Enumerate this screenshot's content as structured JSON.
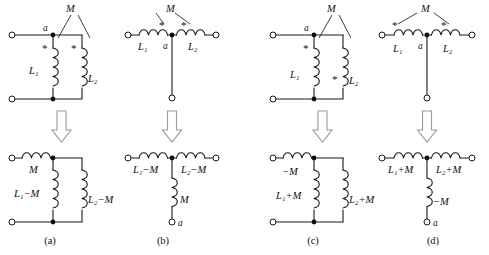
{
  "figure": {
    "background_color": "#ffffff",
    "ink_color": "#101010",
    "arrow_color": "#9a9a9a",
    "transform_arrow_icon": "down-arrow-hollow"
  },
  "symbols": {
    "dot_marker": "*",
    "node_dot": "node-dot",
    "open_terminal": "open-terminal-circle",
    "coil": "inductor-coil",
    "mutual_label": "M",
    "node_label": "a"
  },
  "panels": [
    {
      "id": "a",
      "caption": "(a)",
      "orientation": "parallel-vertical",
      "top": {
        "mutual_label": "M",
        "node_label": "a",
        "left_coil_label": "L₁",
        "right_coil_label": "L₂",
        "left_dot_position": "top",
        "right_dot_position": "top"
      },
      "bottom": {
        "series_coil_label": "M",
        "left_coil_label": "L₁−M",
        "right_coil_label": "L₂−M"
      }
    },
    {
      "id": "b",
      "caption": "(b)",
      "orientation": "series-horizontal",
      "top": {
        "mutual_label": "M",
        "node_label": "a",
        "left_coil_label": "L₁",
        "right_coil_label": "L₂",
        "left_dot_position": "inner",
        "right_dot_position": "inner"
      },
      "bottom": {
        "left_coil_label": "L₁−M",
        "right_coil_label": "L₂−M",
        "stem_coil_label": "M",
        "stem_terminal_label": "a"
      }
    },
    {
      "id": "c",
      "caption": "(c)",
      "orientation": "parallel-vertical",
      "top": {
        "mutual_label": "M",
        "node_label": "a",
        "left_coil_label": "L₁",
        "right_coil_label": "L₂",
        "left_dot_position": "top",
        "right_dot_position": "bottom"
      },
      "bottom": {
        "series_coil_label": "−M",
        "left_coil_label": "L₁+M",
        "right_coil_label": "L₂+M"
      }
    },
    {
      "id": "d",
      "caption": "(d)",
      "orientation": "series-horizontal",
      "top": {
        "mutual_label": "M",
        "node_label": "a",
        "left_coil_label": "L₁",
        "right_coil_label": "L₂",
        "left_dot_position": "outer",
        "right_dot_position": "outer"
      },
      "bottom": {
        "left_coil_label": "L₁+M",
        "right_coil_label": "L₂+M",
        "stem_coil_label": "−M",
        "stem_terminal_label": "a"
      }
    }
  ]
}
